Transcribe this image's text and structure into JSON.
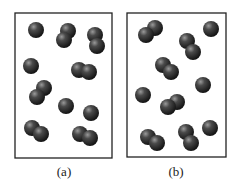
{
  "panels": [
    {
      "label": "(a)",
      "particles": [
        {
          "type": "atom",
          "centers": [
            [
              36,
              30
            ]
          ]
        },
        {
          "type": "molecule",
          "centers": [
            [
              68,
              31
            ],
            [
              64,
              40
            ]
          ]
        },
        {
          "type": "molecule",
          "centers": [
            [
              95,
              35
            ],
            [
              97,
              46
            ]
          ]
        },
        {
          "type": "atom",
          "centers": [
            [
              31,
              66
            ]
          ]
        },
        {
          "type": "molecule",
          "centers": [
            [
              79,
              70
            ],
            [
              89,
              72
            ]
          ]
        },
        {
          "type": "molecule",
          "centers": [
            [
              44,
              88
            ],
            [
              37,
              97
            ]
          ]
        },
        {
          "type": "atom",
          "centers": [
            [
              66,
              106
            ]
          ]
        },
        {
          "type": "atom",
          "centers": [
            [
              91,
              113
            ]
          ]
        },
        {
          "type": "molecule",
          "centers": [
            [
              32,
              128
            ],
            [
              41,
              134
            ]
          ]
        },
        {
          "type": "molecule",
          "centers": [
            [
              80,
              134
            ],
            [
              90,
              138
            ]
          ]
        }
      ]
    },
    {
      "label": "(b)",
      "particles": [
        {
          "type": "molecule",
          "centers": [
            [
              155,
              28
            ],
            [
              146,
              35
            ]
          ]
        },
        {
          "type": "atom",
          "centers": [
            [
              211,
              29
            ]
          ]
        },
        {
          "type": "molecule",
          "centers": [
            [
              187,
              41
            ],
            [
              193,
              52
            ]
          ]
        },
        {
          "type": "molecule",
          "centers": [
            [
              163,
              65
            ],
            [
              171,
              72
            ]
          ]
        },
        {
          "type": "atom",
          "centers": [
            [
              203,
              85
            ]
          ]
        },
        {
          "type": "atom",
          "centers": [
            [
              143,
              95
            ]
          ]
        },
        {
          "type": "molecule",
          "centers": [
            [
              177,
              102
            ],
            [
              168,
              107
            ]
          ]
        },
        {
          "type": "atom",
          "centers": [
            [
              210,
              128
            ]
          ]
        },
        {
          "type": "molecule",
          "centers": [
            [
              148,
              137
            ],
            [
              157,
              143
            ]
          ]
        },
        {
          "type": "molecule",
          "centers": [
            [
              186,
              132
            ],
            [
              191,
              143
            ]
          ]
        }
      ]
    }
  ]
}
